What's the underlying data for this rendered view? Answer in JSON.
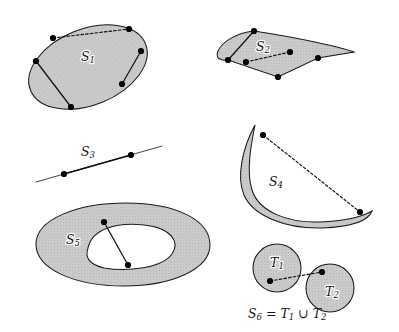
{
  "figure": {
    "background_color": "#ffffff",
    "fill_color": "#c9c9c9",
    "stroke_color": "#1a1a1a",
    "point_color": "#000000",
    "width": 399,
    "height": 332
  },
  "labels": {
    "s1": {
      "base": "S",
      "sub": "1",
      "x": 88,
      "y": 57
    },
    "s2": {
      "base": "S",
      "sub": "2",
      "x": 263,
      "y": 47
    },
    "s3": {
      "base": "S",
      "sub": "3",
      "x": 88,
      "y": 152
    },
    "s4": {
      "base": "S",
      "sub": "4",
      "x": 276,
      "y": 182
    },
    "s5": {
      "base": "S",
      "sub": "5",
      "x": 73,
      "y": 240
    },
    "t1": {
      "base": "T",
      "sub": "1",
      "x": 277,
      "y": 268
    },
    "t2": {
      "base": "T",
      "sub": "2",
      "x": 330,
      "y": 290
    }
  },
  "caption": {
    "x": 248,
    "y": 314,
    "s": "S",
    "s_sub": "6",
    "equals": " = ",
    "t1": "T",
    "t1_sub": "1",
    "union": " ∪ ",
    "t2": "T",
    "t2_sub": "2",
    "full_text": "S6 = T1 ∪ T2"
  },
  "sets": [
    {
      "id": "S1",
      "name": "ellipse-region",
      "convex": true,
      "shape": "rotated ellipse",
      "points": [
        {
          "x": 53,
          "y": 38
        },
        {
          "x": 129,
          "y": 29
        },
        {
          "x": 141,
          "y": 51
        },
        {
          "x": 122,
          "y": 84
        },
        {
          "x": 36,
          "y": 61
        },
        {
          "x": 71,
          "y": 107
        }
      ],
      "segments": [
        {
          "from": 0,
          "to": 1,
          "style": "dashed"
        },
        {
          "from": 2,
          "to": 3,
          "style": "solid"
        },
        {
          "from": 4,
          "to": 5,
          "style": "solid"
        }
      ]
    },
    {
      "id": "S2",
      "name": "curved-triangle-region",
      "convex": false,
      "shape": "triangle with concave top-left arc",
      "points": [
        {
          "x": 254,
          "y": 31
        },
        {
          "x": 228,
          "y": 60
        },
        {
          "x": 246,
          "y": 62
        },
        {
          "x": 290,
          "y": 52
        },
        {
          "x": 318,
          "y": 58
        },
        {
          "x": 278,
          "y": 77
        }
      ],
      "segments": [
        {
          "from": 0,
          "to": 1,
          "style": "solid"
        },
        {
          "from": 2,
          "to": 3,
          "style": "dashed"
        }
      ]
    },
    {
      "id": "S3",
      "name": "line-segment-region",
      "convex": true,
      "shape": "straight line",
      "points": [
        {
          "x": 64,
          "y": 174
        },
        {
          "x": 131,
          "y": 155
        }
      ],
      "segments": [
        {
          "from": 0,
          "to": 1,
          "style": "thick"
        }
      ]
    },
    {
      "id": "S4",
      "name": "crescent-region",
      "convex": false,
      "shape": "banana / crescent",
      "points": [
        {
          "x": 263,
          "y": 135
        },
        {
          "x": 360,
          "y": 212
        }
      ],
      "segments": [
        {
          "from": 0,
          "to": 1,
          "style": "thin"
        }
      ]
    },
    {
      "id": "S5",
      "name": "annulus-region",
      "convex": false,
      "shape": "ellipse with hole",
      "points": [
        {
          "x": 104,
          "y": 222
        },
        {
          "x": 128,
          "y": 265
        }
      ],
      "segments": [
        {
          "from": 0,
          "to": 1,
          "style": "solid"
        }
      ]
    },
    {
      "id": "S6",
      "name": "two-disjoint-disks-region",
      "convex": false,
      "shape": "union of two circles",
      "points": [
        {
          "x": 270,
          "y": 281
        },
        {
          "x": 322,
          "y": 272
        }
      ],
      "segments": [
        {
          "from": 0,
          "to": 1,
          "style": "dashed"
        }
      ]
    }
  ]
}
